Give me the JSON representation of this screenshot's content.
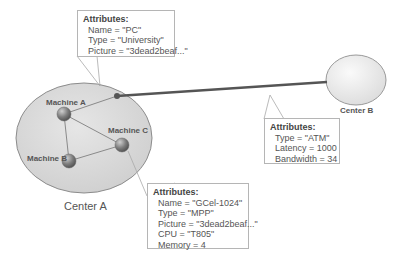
{
  "centers": [
    {
      "id": "center-a",
      "label": "Center A"
    },
    {
      "id": "center-b",
      "label": "Center B"
    }
  ],
  "machines": [
    {
      "id": "machine-a",
      "label": "Machine A"
    },
    {
      "id": "machine-b",
      "label": "Machine B"
    },
    {
      "id": "machine-c",
      "label": "Machine C"
    }
  ],
  "attribute_boxes": {
    "center_a": {
      "title": "Attributes:",
      "rows": [
        "Name = \"PC\"",
        "Type = \"University\"",
        "Picture = \"3dead2beaf...\""
      ]
    },
    "link": {
      "title": "Attributes:",
      "rows": [
        "Type = \"ATM\"",
        "Latency = 1000",
        "Bandwidth = 34"
      ]
    },
    "machine_c": {
      "title": "Attributes:",
      "rows": [
        "Name = \"GCel-1024\"",
        "Type = \"MPP\"",
        "Picture = \"3dead2beaf...\"",
        "CPU = \"T805\"",
        "Memory = 4"
      ]
    }
  },
  "colors": {
    "ellipse_fill": "#d9d9d9",
    "ellipse_stroke": "#8c8c8c",
    "link": "#555555",
    "node": "#7a7a7a"
  }
}
